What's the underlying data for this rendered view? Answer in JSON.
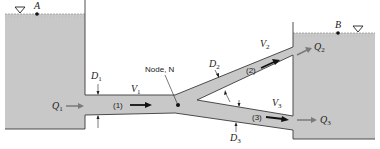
{
  "figure": {
    "type": "pipe-network-schematic",
    "colors": {
      "water": "#c8c8c8",
      "outline": "#3a3a3a",
      "flow_arrow_dark": "#111111",
      "flow_arrow_gray": "#7a7a7a",
      "background": "#ffffff"
    },
    "reservoirs": [
      {
        "id": "A",
        "point_label": "A",
        "surface_symbol": "∇"
      },
      {
        "id": "B",
        "point_label": "B",
        "surface_symbol": "∇"
      }
    ],
    "node": {
      "label": "Node, N"
    },
    "pipes": [
      {
        "id": "1",
        "label": "(1)",
        "diameter": "D",
        "diameter_sub": "1",
        "velocity": "V",
        "velocity_sub": "1",
        "flow": "Q",
        "flow_sub": "1"
      },
      {
        "id": "2",
        "label": "(2)",
        "diameter": "D",
        "diameter_sub": "2",
        "velocity": "V",
        "velocity_sub": "2",
        "flow": "Q",
        "flow_sub": "2"
      },
      {
        "id": "3",
        "label": "(3)",
        "diameter": "D",
        "diameter_sub": "3",
        "velocity": "V",
        "velocity_sub": "3",
        "flow": "Q",
        "flow_sub": "3"
      }
    ]
  }
}
